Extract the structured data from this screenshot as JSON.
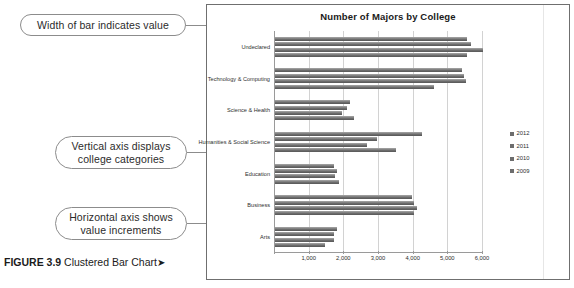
{
  "figure": {
    "caption_label": "FIGURE 3.9",
    "caption_text": " Clustered Bar Chart",
    "caption_arrow": "➤"
  },
  "annotations": [
    {
      "id": "width-of-bar",
      "text": "Width of bar indicates value"
    },
    {
      "id": "vertical-axis",
      "text": "Vertical axis displays college categories"
    },
    {
      "id": "horizontal-axis",
      "text": "Horizontal axis shows value increments"
    }
  ],
  "chart_data": {
    "type": "bar",
    "orientation": "horizontal",
    "title": "Number of Majors by College",
    "xlabel": "",
    "ylabel": "",
    "xlim": [
      0,
      6000
    ],
    "xticks": [
      0,
      1000,
      2000,
      3000,
      4000,
      5000,
      6000
    ],
    "xtick_labels": [
      "",
      "1,000",
      "2,000",
      "3,000",
      "4,000",
      "5,000",
      "6,000"
    ],
    "grid": true,
    "legend_position": "right",
    "bar_color": "#6d6d6d",
    "categories": [
      "Undeclared",
      "Technology & Computing",
      "Science & Health",
      "Humanities & Social Science",
      "Education",
      "Business",
      "Arts"
    ],
    "series": [
      {
        "name": "2012",
        "values": [
          5550,
          5400,
          2150,
          4250,
          1700,
          3950,
          1800
        ]
      },
      {
        "name": "2011",
        "values": [
          5650,
          5450,
          2080,
          2950,
          1780,
          4000,
          1700
        ]
      },
      {
        "name": "2010",
        "values": [
          6000,
          5500,
          1930,
          2650,
          1730,
          4100,
          1700
        ]
      },
      {
        "name": "2009",
        "values": [
          5550,
          4600,
          2280,
          3500,
          1850,
          4000,
          1450
        ]
      }
    ]
  },
  "legend": {
    "items": [
      "2012",
      "2011",
      "2010",
      "2009"
    ]
  }
}
